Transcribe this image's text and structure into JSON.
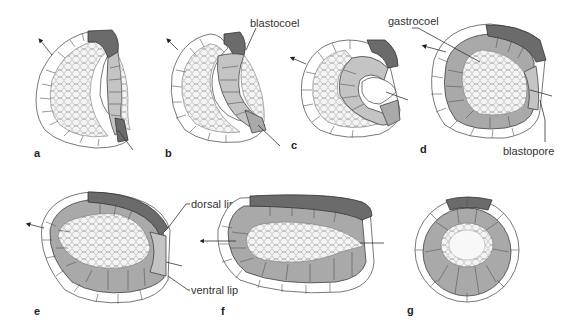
{
  "figure": {
    "panels": [
      {
        "id": "a",
        "letter": "a"
      },
      {
        "id": "b",
        "letter": "b"
      },
      {
        "id": "c",
        "letter": "c"
      },
      {
        "id": "d",
        "letter": "d"
      },
      {
        "id": "e",
        "letter": "e"
      },
      {
        "id": "f",
        "letter": "f"
      },
      {
        "id": "g",
        "letter": "g"
      }
    ],
    "labels": {
      "blastocoel": "blastocoel",
      "gastrocoel": "gastrocoel",
      "blastopore": "blastopore",
      "dorsal_lip": "dorsal lip",
      "ventral_lip": "ventral lip"
    },
    "colors": {
      "ectoderm": "#ffffff",
      "mesoderm": "#a9a9a9",
      "endoderm": "#c4c4c4",
      "dark_cells": "#6b6b6b",
      "yolk": "#f3f3f3"
    }
  }
}
